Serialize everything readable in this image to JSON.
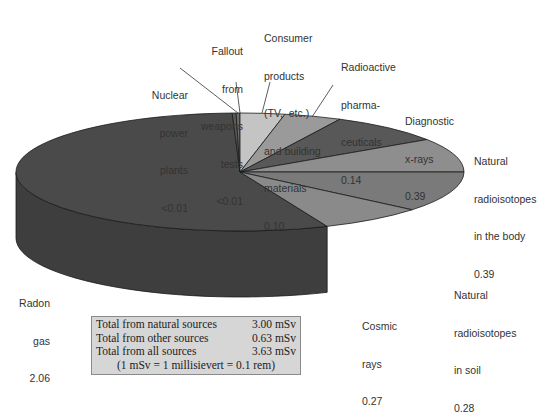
{
  "chart_data": {
    "type": "pie",
    "style": "3d",
    "unit": "mSv",
    "slices": [
      {
        "label": "Radon gas",
        "value": 2.06,
        "value_text": "2.06",
        "color": "#4a4a4a",
        "side_color": "#3e3e3e"
      },
      {
        "label": "Nuclear power plants",
        "value": 0.005,
        "value_text": "<0.01",
        "color": "#5a5a5a",
        "side_color": "#4c4c4c"
      },
      {
        "label": "Fallout from weapons tests",
        "value": 0.005,
        "value_text": "<0.01",
        "color": "#6c6c6c",
        "side_color": "#5a5a5a"
      },
      {
        "label": "Consumer products (TV, etc.) and building materials",
        "value": 0.1,
        "value_text": "0.10",
        "color": "#c4c4c4",
        "side_color": "#a8a8a8"
      },
      {
        "label": "Radioactive pharmaceuticals",
        "value": 0.14,
        "value_text": "0.14",
        "color": "#9a9a9a",
        "side_color": "#848484"
      },
      {
        "label": "Diagnostic x-rays",
        "value": 0.39,
        "value_text": "0.39",
        "color": "#585858",
        "side_color": "#4a4a4a"
      },
      {
        "label": "Natural radioisotopes in the body",
        "value": 0.39,
        "value_text": "0.39",
        "color": "#8e8e8e",
        "side_color": "#777777"
      },
      {
        "label": "Natural radioisotopes in soil",
        "value": 0.28,
        "value_text": "0.28",
        "color": "#7a7a7a",
        "side_color": "#5e5e5e"
      },
      {
        "label": "Cosmic rays",
        "value": 0.27,
        "value_text": "0.27",
        "color": "#8a8a8a",
        "side_color": "#6a6a6a"
      }
    ],
    "summary": [
      {
        "label": "Total from natural sources",
        "value": "3.00 mSv"
      },
      {
        "label": "Total from other sources",
        "value": "0.63 mSv"
      },
      {
        "label": "Total from all sources",
        "value": "3.63 mSv"
      }
    ],
    "note": "(1 mSv = 1 millisievert = 0.1 rem)"
  },
  "labels": {
    "nuclear": [
      "Nuclear",
      "power",
      "plants",
      "<0.01"
    ],
    "fallout": [
      "Fallout",
      "from",
      "weapons",
      "tests",
      "<0.01"
    ],
    "consumer": [
      "Consumer",
      "products",
      "(TV,  etc.)",
      "and building",
      "materials",
      "0.10"
    ],
    "pharma": [
      "Radioactive",
      "pharma-",
      "ceuticals",
      "0.14"
    ],
    "xray": [
      "Diagnostic",
      "x-rays",
      "0.39"
    ],
    "body": [
      "Natural",
      "radioisotopes",
      "in the body",
      "0.39"
    ],
    "soil": [
      "Natural",
      "radioisotopes",
      "in soil",
      "0.28"
    ],
    "cosmic": [
      "Cosmic",
      "rays",
      "0.27"
    ],
    "radon": [
      "Radon",
      "gas",
      "2.06"
    ]
  }
}
